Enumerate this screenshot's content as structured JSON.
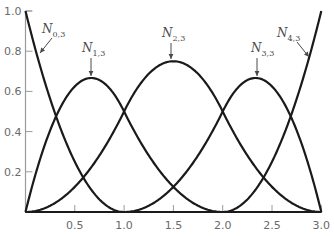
{
  "chart_data": {
    "type": "line",
    "title": "",
    "xlabel": "",
    "ylabel": "",
    "xlim": [
      0,
      3.0
    ],
    "ylim": [
      0,
      1.0
    ],
    "grid": false,
    "legend": "none (curves labeled directly with arrows)",
    "x_ticks": [
      0.5,
      1.0,
      1.5,
      2.0,
      2.5,
      3.0
    ],
    "x_tick_labels": [
      "0.5",
      "1.0",
      "1.5",
      "2.0",
      "2.5",
      "3.0"
    ],
    "y_ticks": [
      0.2,
      0.4,
      0.6,
      0.8,
      1.0
    ],
    "y_tick_labels": [
      "0.2",
      "0.4",
      "0.6",
      "0.8",
      "1.0"
    ],
    "knots": [
      0,
      0,
      0,
      1,
      2,
      3,
      3,
      3
    ],
    "series": [
      {
        "name": "N0,3",
        "label_main": "N",
        "label_sub": "0,3",
        "x": [
          0,
          0.25,
          0.5,
          0.75,
          1.0,
          1.5,
          2.0,
          2.5,
          3.0
        ],
        "values": [
          1.0,
          0.5625,
          0.25,
          0.0625,
          0,
          0,
          0,
          0,
          0
        ]
      },
      {
        "name": "N1,3",
        "label_main": "N",
        "label_sub": "1,3",
        "x": [
          0,
          0.25,
          0.5,
          0.667,
          0.75,
          1.0,
          1.5,
          2.0,
          2.5,
          3.0
        ],
        "values": [
          0,
          0.406,
          0.625,
          0.667,
          0.656,
          0.5,
          0.125,
          0,
          0,
          0
        ]
      },
      {
        "name": "N2,3",
        "label_main": "N",
        "label_sub": "2,3",
        "x": [
          0,
          0.5,
          1.0,
          1.5,
          2.0,
          2.5,
          3.0
        ],
        "values": [
          0,
          0.125,
          0.5,
          0.75,
          0.5,
          0.125,
          0
        ]
      },
      {
        "name": "N3,3",
        "label_main": "N",
        "label_sub": "3,3",
        "x": [
          0,
          0.5,
          1.0,
          1.5,
          2.0,
          2.25,
          2.333,
          2.5,
          2.75,
          3.0
        ],
        "values": [
          0,
          0,
          0,
          0.125,
          0.5,
          0.656,
          0.667,
          0.625,
          0.406,
          0
        ]
      },
      {
        "name": "N4,3",
        "label_main": "N",
        "label_sub": "4,3",
        "x": [
          0,
          0.5,
          1.0,
          1.5,
          2.0,
          2.25,
          2.5,
          2.75,
          3.0
        ],
        "values": [
          0,
          0,
          0,
          0,
          0,
          0.0625,
          0.25,
          0.5625,
          1.0
        ]
      }
    ],
    "annotations": [
      {
        "series": "N0,3",
        "text_x": 42,
        "text_y": 33,
        "arrow_from": [
          52,
          38
        ],
        "arrow_to": [
          40,
          53
        ]
      },
      {
        "series": "N1,3",
        "text_x": 82,
        "text_y": 52,
        "arrow_from": [
          91,
          58
        ],
        "arrow_to": [
          91,
          76
        ]
      },
      {
        "series": "N2,3",
        "text_x": 162,
        "text_y": 37,
        "arrow_from": [
          171,
          43
        ],
        "arrow_to": [
          171,
          59
        ]
      },
      {
        "series": "N3,3",
        "text_x": 251,
        "text_y": 52,
        "arrow_from": [
          257,
          58
        ],
        "arrow_to": [
          257,
          76
        ]
      },
      {
        "series": "N4,3",
        "text_x": 277,
        "text_y": 37,
        "arrow_from": [
          297,
          42
        ],
        "arrow_to": [
          309,
          57
        ]
      }
    ]
  },
  "layout": {
    "plot_px": {
      "x0": 25.5,
      "y0": 212,
      "px_per_x": 98.6,
      "px_per_y": 201
    }
  }
}
